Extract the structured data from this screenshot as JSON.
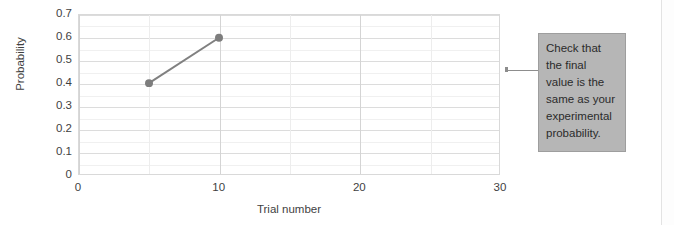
{
  "chart_data": {
    "type": "line",
    "title": "",
    "xlabel": "Trial number",
    "ylabel": "Probability",
    "xlim": [
      0,
      30
    ],
    "ylim": [
      0,
      0.7
    ],
    "grid": true,
    "legend": "none",
    "x": [
      5,
      10
    ],
    "values": [
      0.4,
      0.6
    ],
    "series": [
      {
        "name": "Probability",
        "x": [
          5,
          10
        ],
        "values": [
          0.4,
          0.6
        ],
        "color": "#808080",
        "marker": "circle"
      }
    ],
    "ytick_labels": [
      "0.7",
      "0.6",
      "0.5",
      "0.4",
      "0.3",
      "0.2",
      "0.1",
      "0"
    ],
    "ytick_values": [
      0.7,
      0.6,
      0.5,
      0.4,
      0.3,
      0.2,
      0.1,
      0
    ],
    "xtick_labels": [
      "0",
      "10",
      "20",
      "30"
    ],
    "xtick_values": [
      0,
      10,
      20,
      30
    ],
    "minor_y_step": 0.05,
    "minor_x_step": 5,
    "annotations": [
      {
        "text": "Check that the final value is the same as your experimental probability.",
        "target_x": 30,
        "target_y": 0.35
      }
    ]
  },
  "callout": {
    "text": "Check that\nthe final\nvalue is the\nsame as your\nexperimental\nprobability.",
    "background_color": "#b6b6b6",
    "border_color": "#9e9e9e",
    "text_color": "#2b2b2b"
  },
  "colors": {
    "series": "#808080",
    "marker": "#7d7d7d",
    "grid_major": "#dcdcdc",
    "grid_minor": "#f0f0f0",
    "axis_text": "#3f3f3f",
    "plot_border": "#d9d9d9",
    "leader_line": "#8d8d8d"
  }
}
